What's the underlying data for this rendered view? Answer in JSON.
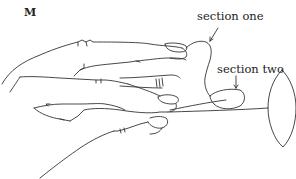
{
  "figure": {
    "letter": "M",
    "labels": {
      "section_one": "section one",
      "section_two": "section two"
    },
    "elements": [
      "upper-hand",
      "ring",
      "lower-hand",
      "string",
      "section-one-loop",
      "section-two-loop",
      "weight-disc"
    ],
    "line_color": "#333333",
    "background": "#ffffff"
  }
}
